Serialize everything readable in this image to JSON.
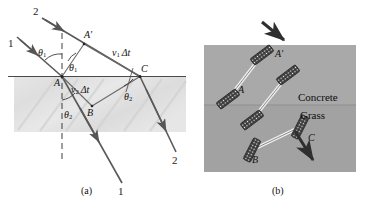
{
  "figure": {
    "panels": [
      {
        "id": "a",
        "caption": "(a)"
      },
      {
        "id": "b",
        "caption": "(b)"
      }
    ]
  },
  "panel_a": {
    "caption": "(a)",
    "ray_labels": {
      "incident_top": "2",
      "incident_bottom": "1",
      "refracted_bottom_left": "1",
      "refracted_bottom_right": "2"
    },
    "points": {
      "a": "A",
      "a_prime": "A",
      "a_prime_mark": "′",
      "b": "B",
      "c": "C"
    },
    "angles": {
      "theta1_left": "θ",
      "theta1_left_sub": "1",
      "theta1_right": "θ",
      "theta1_right_sub": "1",
      "theta2_left": "θ",
      "theta2_left_sub": "2",
      "theta2_right": "θ",
      "theta2_right_sub": "2"
    },
    "distances": {
      "upper_v": "v",
      "upper_sub": "1",
      "upper_dt": "Δt",
      "lower_v": "v",
      "lower_sub": "2",
      "lower_dt": "Δt"
    }
  },
  "panel_b": {
    "caption": "(b)",
    "media": {
      "upper": "Concrete",
      "lower": "Grass"
    },
    "points": {
      "a": "A",
      "a_prime": "A",
      "a_prime_mark": "′",
      "b": "B",
      "c": "C"
    }
  },
  "colors": {
    "ink": "#111111",
    "ray": "#555555",
    "medium_shade_a": "#e2e2e2",
    "medium_shade_b_upper": "#a8a8a8",
    "medium_shade_b_lower": "#a0a0a0",
    "wheel_dark": "#3a3a3a",
    "axle_light": "#f2f2f2",
    "background": "#ffffff"
  }
}
